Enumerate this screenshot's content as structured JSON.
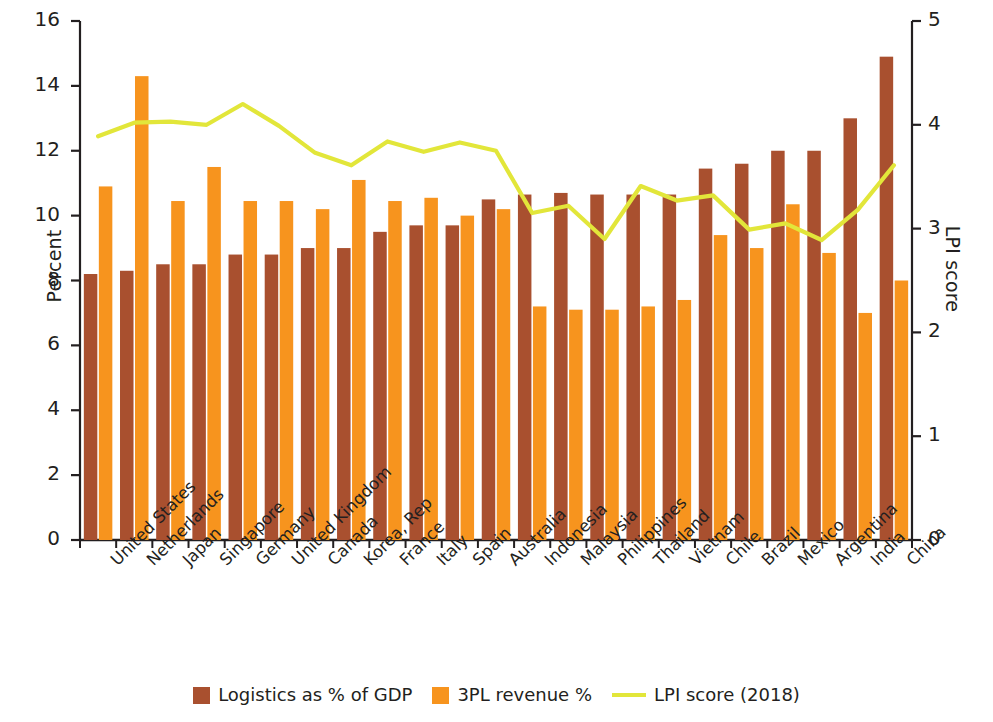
{
  "chart_data": {
    "type": "bar",
    "title": "",
    "subtitle": "",
    "xlabel": "",
    "ylabel": "Percent",
    "y2label": "LPI score",
    "ylim": [
      0,
      16
    ],
    "y2lim": [
      0,
      5
    ],
    "yticks": [
      "0",
      "2",
      "4",
      "6",
      "8",
      "10",
      "12",
      "14",
      "16"
    ],
    "y2ticks": [
      "0",
      "1",
      "2",
      "3",
      "4",
      "5"
    ],
    "grid": false,
    "legend_position": "bottom-center",
    "categories": [
      "United States",
      "Netherlands",
      "Japan",
      "Singapore",
      "Germany",
      "United Kingdom",
      "Canada",
      "Korea, Rep",
      "France",
      "Italy",
      "Spain",
      "Australia",
      "Indonesia",
      "Malaysia",
      "Philippines",
      "Thailand",
      "Vietnam",
      "Chile",
      "Brazil",
      "Mexico",
      "Argentina",
      "India",
      "China"
    ],
    "series": [
      {
        "name": "Logistics as % of GDP",
        "type": "bar",
        "color": "#a9502f",
        "axis": "left",
        "values": [
          8.2,
          8.3,
          8.5,
          8.5,
          8.8,
          8.8,
          9.0,
          9.0,
          9.5,
          9.7,
          9.7,
          10.5,
          10.65,
          10.7,
          10.65,
          10.65,
          10.65,
          11.45,
          11.6,
          12.0,
          12.0,
          13.0,
          14.9
        ]
      },
      {
        "name": "3PL revenue %",
        "type": "bar",
        "color": "#f7941e",
        "axis": "left",
        "values": [
          10.9,
          14.3,
          10.45,
          11.5,
          10.45,
          10.45,
          10.2,
          11.1,
          10.45,
          10.55,
          10.0,
          10.2,
          7.2,
          7.1,
          7.1,
          7.2,
          7.4,
          9.4,
          9.0,
          10.35,
          8.85,
          7.0,
          8.0
        ]
      },
      {
        "name": "LPI score (2018)",
        "type": "line",
        "color": "#e2e63a",
        "axis": "right",
        "values": [
          3.89,
          4.02,
          4.03,
          4.0,
          4.2,
          3.99,
          3.73,
          3.61,
          3.84,
          3.74,
          3.83,
          3.75,
          3.15,
          3.22,
          2.9,
          3.41,
          3.27,
          3.32,
          2.99,
          3.05,
          2.89,
          3.18,
          3.61
        ]
      }
    ],
    "legend": [
      {
        "label": "Logistics as % of GDP",
        "color": "#a9502f",
        "marker": "square"
      },
      {
        "label": "3PL revenue %",
        "color": "#f7941e",
        "marker": "square"
      },
      {
        "label": "LPI score (2018)",
        "color": "#e2e63a",
        "marker": "line"
      }
    ]
  }
}
